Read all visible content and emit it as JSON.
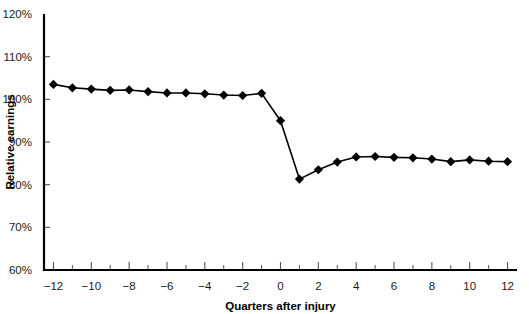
{
  "chart_data": {
    "type": "line",
    "title": "",
    "xlabel": "Quarters after injury",
    "ylabel": "Relative earnings",
    "xlim": [
      -12.5,
      12.5
    ],
    "ylim": [
      60,
      120
    ],
    "grid": false,
    "legend": false,
    "y_tick_labels": [
      "120%",
      "110%",
      "100%",
      "90%",
      "80%",
      "70%",
      "60%"
    ],
    "y_ticks": [
      120,
      110,
      100,
      90,
      80,
      70,
      60
    ],
    "x_ticks": [
      -12,
      -10,
      -8,
      -6,
      -4,
      -2,
      0,
      2,
      4,
      6,
      8,
      10,
      12
    ],
    "x_tick_labels": [
      "−12",
      "−10",
      "−8",
      "−6",
      "−4",
      "−2",
      "0",
      "2",
      "4",
      "6",
      "8",
      "10",
      "12"
    ],
    "x_minor_ticks": [
      -11,
      -9,
      -7,
      -5,
      -3,
      -1,
      1,
      3,
      5,
      7,
      9,
      11
    ],
    "x": [
      -12,
      -11,
      -10,
      -9,
      -8,
      -7,
      -6,
      -5,
      -4,
      -3,
      -2,
      -1,
      0,
      1,
      2,
      3,
      4,
      5,
      6,
      7,
      8,
      9,
      10,
      11,
      12
    ],
    "values": [
      103.5,
      102.7,
      102.4,
      102.1,
      102.2,
      101.8,
      101.5,
      101.5,
      101.3,
      101.0,
      100.9,
      101.4,
      95.0,
      81.3,
      83.5,
      85.3,
      86.5,
      86.6,
      86.4,
      86.3,
      86.0,
      85.4,
      85.8,
      85.5,
      85.4
    ],
    "series": [
      {
        "name": "Relative earnings",
        "marker": "diamond",
        "color": "#000000",
        "values": [
          103.5,
          102.7,
          102.4,
          102.1,
          102.2,
          101.8,
          101.5,
          101.5,
          101.3,
          101.0,
          100.9,
          101.4,
          95.0,
          81.3,
          83.5,
          85.3,
          86.5,
          86.6,
          86.4,
          86.3,
          86.0,
          85.4,
          85.8,
          85.5,
          85.4
        ]
      }
    ],
    "annotations": []
  },
  "colors": {
    "line": "#000000",
    "marker": "#000000",
    "axis": "#000000",
    "background": "#ffffff",
    "text": "#1a1a1a"
  }
}
